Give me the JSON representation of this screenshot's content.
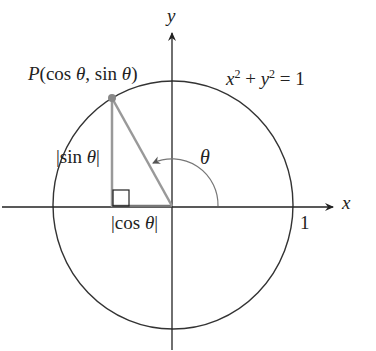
{
  "diagram": {
    "axes": {
      "x_label": "x",
      "y_label": "y"
    },
    "circle_equation": {
      "x": "x",
      "exp1": "2",
      "plus": " + ",
      "y": "y",
      "exp2": "2",
      "rhs": " = 1"
    },
    "point_label": {
      "P": "P",
      "rest": "(cos ",
      "theta1": "θ",
      "mid": ", sin ",
      "theta2": "θ",
      "close": ")"
    },
    "sin_label": {
      "open": "|sin ",
      "theta": "θ",
      "close": "|"
    },
    "cos_label": {
      "open": "|cos ",
      "theta": "θ",
      "close": "|"
    },
    "angle_label": "θ",
    "unit_tick_label": "1",
    "colors": {
      "axis": "#222222",
      "circle": "#333333",
      "triangle": "#999999",
      "point": "#888888"
    }
  }
}
